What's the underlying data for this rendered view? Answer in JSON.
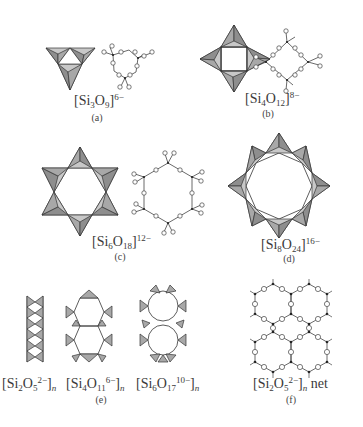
{
  "figure": {
    "panels": [
      {
        "id": "a",
        "caption": "(a)",
        "formula": {
          "base": "Si",
          "n1": "3",
          "o": "O",
          "n2": "9",
          "charge": "6−"
        },
        "ring_size": 3
      },
      {
        "id": "b",
        "caption": "(b)",
        "formula": {
          "base": "Si",
          "n1": "4",
          "o": "O",
          "n2": "12",
          "charge": "8−"
        },
        "ring_size": 4
      },
      {
        "id": "c",
        "caption": "(c)",
        "formula": {
          "base": "Si",
          "n1": "6",
          "o": "O",
          "n2": "18",
          "charge": "12−"
        },
        "ring_size": 6
      },
      {
        "id": "d",
        "caption": "(d)",
        "formula": {
          "base": "Si",
          "n1": "8",
          "o": "O",
          "n2": "24",
          "charge": "16−"
        },
        "ring_size": 8
      },
      {
        "id": "e",
        "caption": "(e)",
        "formulas": [
          {
            "base": "Si",
            "n1": "2",
            "o": "O",
            "n2": "5",
            "charge": "2−",
            "suffix": "n"
          },
          {
            "base": "Si",
            "n1": "4",
            "o": "O",
            "n2": "11",
            "charge": "6−",
            "suffix": "n"
          },
          {
            "base": "Si",
            "n1": "6",
            "o": "O",
            "n2": "17",
            "charge": "10−",
            "suffix": "n"
          }
        ]
      },
      {
        "id": "f",
        "caption": "(f)",
        "formula": {
          "base": "Si",
          "n1": "2",
          "o": "O",
          "n2": "5",
          "charge": "2−",
          "suffix": "n",
          "tail": " net"
        }
      }
    ]
  }
}
